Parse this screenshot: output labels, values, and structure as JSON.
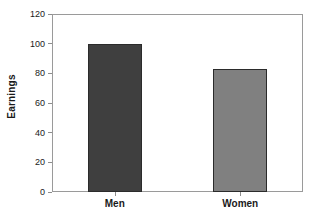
{
  "chart_data": {
    "type": "bar",
    "title": "",
    "xlabel": "",
    "ylabel": "Earnings",
    "categories": [
      "Men",
      "Women"
    ],
    "values": [
      100,
      83
    ],
    "ylim": [
      0,
      120
    ],
    "yticks": [
      0,
      20,
      40,
      60,
      80,
      100,
      120
    ],
    "ytick_labels": [
      "0",
      "20",
      "40",
      "60",
      "80",
      "100",
      "120"
    ],
    "grid": false,
    "legend": false,
    "legend_position": "none",
    "series": [
      {
        "name": "Earnings",
        "values": [
          100,
          83
        ],
        "colors": [
          "#3f3f3f",
          "#808080"
        ]
      }
    ],
    "bar_colors": {
      "men": "#3f3f3f",
      "women": "#808080"
    },
    "annotations": []
  },
  "style": {
    "background": "#ffffff",
    "frame_color": "#9a9a9a",
    "tick_color": "#8d8d8d",
    "text_color": "#1a1a1a",
    "bar_outline": "#2b2b2b"
  }
}
